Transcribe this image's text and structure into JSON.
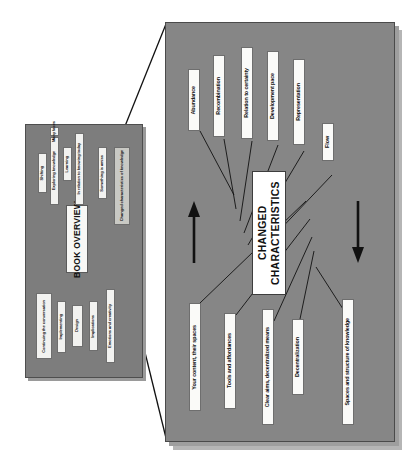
{
  "slide": {
    "type": "book-overview-mindmap",
    "orientation": "rotated-90",
    "colors": {
      "small_panel_bg": "#7d7d7d",
      "big_panel_bg": "#868686",
      "node_bg": "#f2f2f0",
      "highlight_bg": "#c9c9c4",
      "center_bg": "#ffffff",
      "line": "#111111",
      "page_bg": "#ffffff"
    }
  },
  "small_panel": {
    "name": "book-overview-panel",
    "title": "BOOK OVERVIEW",
    "top_group": [
      {
        "label": "Shifting",
        "highlighted": false
      },
      {
        "label": "Exploring knowledge",
        "highlighted": false
      },
      {
        "label": "Many faces",
        "highlighted": false
      },
      {
        "label": "Learning",
        "highlighted": false
      },
      {
        "label": "In relation to knowing today",
        "highlighted": false
      },
      {
        "label": "Something is amiss",
        "highlighted": false
      },
      {
        "label": "Changed characteristics of knowledge",
        "highlighted": true
      }
    ],
    "bottom_group": [
      {
        "label": "Continuing the conversation"
      },
      {
        "label": "Implementing"
      },
      {
        "label": "Design"
      },
      {
        "label": "Implications"
      },
      {
        "label": "Emotions and creativity"
      }
    ]
  },
  "big_panel": {
    "name": "changed-characteristics-mindmap",
    "center": "CHANGED CHARACTERISTICS",
    "nodes_upper": [
      {
        "label": "Abundance"
      },
      {
        "label": "Recombination"
      },
      {
        "label": "Relation to certainty"
      },
      {
        "label": "Development pace"
      },
      {
        "label": "Representation"
      },
      {
        "label": "Flow"
      }
    ],
    "nodes_lower": [
      {
        "label": "Your content, their spaces"
      },
      {
        "label": "Tools and affordances"
      },
      {
        "label": "Clear aims, decentralized means"
      },
      {
        "label": "Decentralization"
      },
      {
        "label": "Spaces and structure of knowledge"
      }
    ],
    "arrows": [
      {
        "name": "up-arrow",
        "direction": "up"
      },
      {
        "name": "down-arrow",
        "direction": "down"
      }
    ]
  },
  "zoom_connector": {
    "name": "zoom-callout-lines",
    "from": "Changed characteristics of knowledge",
    "to": "changed-characteristics-mindmap"
  }
}
